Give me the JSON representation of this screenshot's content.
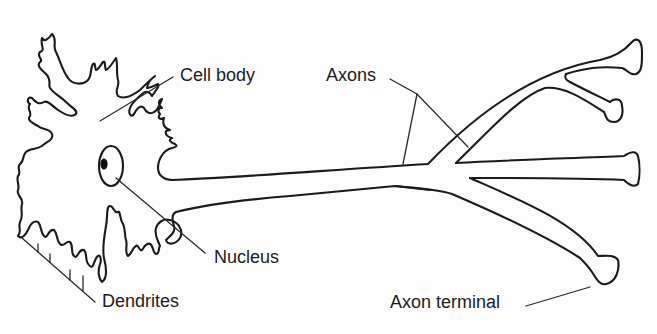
{
  "diagram": {
    "stroke_color": "#1a1a1a",
    "background": "#fdfdfd",
    "labels": [
      {
        "id": "cell-body",
        "text": "Cell body",
        "x": 180,
        "y": 66
      },
      {
        "id": "axons",
        "text": "Axons",
        "x": 326,
        "y": 66
      },
      {
        "id": "nucleus",
        "text": "Nucleus",
        "x": 214,
        "y": 248
      },
      {
        "id": "dendrites",
        "text": "Dendrites",
        "x": 102,
        "y": 292
      },
      {
        "id": "axon-terminal",
        "text": "Axon terminal",
        "x": 390,
        "y": 293
      }
    ]
  }
}
